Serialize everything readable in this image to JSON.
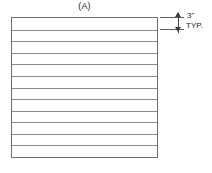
{
  "drawing": {
    "part_label": "(A)",
    "background_color": "#ffffff",
    "outline_color": "#6d6d6d",
    "rule_color": "#8a8a8a",
    "annotation_color": "#3f3f3f"
  },
  "panel": {
    "band_count": 12,
    "internal_rule_count": 11,
    "internal_rules_percent": [
      8.33,
      16.67,
      25.0,
      33.33,
      41.67,
      50.0,
      58.33,
      66.67,
      75.0,
      83.33,
      91.67
    ]
  },
  "dimension": {
    "value": "3\"",
    "note": "TYP.",
    "arrow_up_icon": "arrow-up-icon",
    "arrow_down_icon": "arrow-down-icon"
  }
}
